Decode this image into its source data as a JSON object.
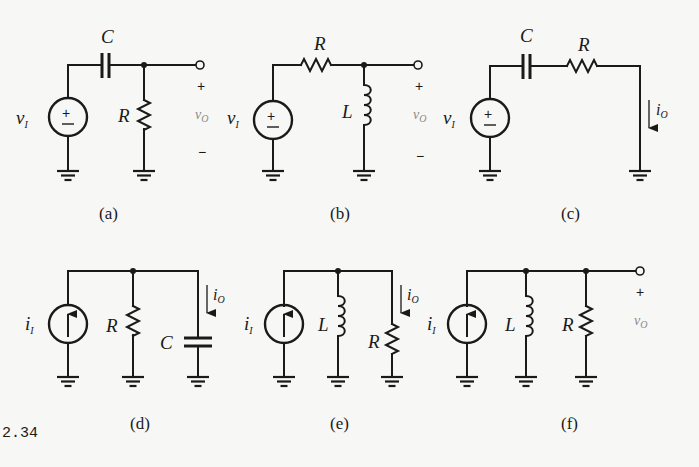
{
  "figure": {
    "number": "2.34",
    "panels": [
      {
        "id": "a",
        "caption": "(a)",
        "source": "v_I",
        "source_label": "v",
        "source_sub": "I",
        "source_type": "voltage",
        "series": [
          "C"
        ],
        "shunt": [
          "R"
        ],
        "output": "v_O",
        "out_label": "v",
        "out_sub": "O",
        "plus": "+",
        "minus": "−",
        "elements": {
          "C": "C",
          "R": "R"
        }
      },
      {
        "id": "b",
        "caption": "(b)",
        "source": "v_I",
        "source_label": "v",
        "source_sub": "I",
        "source_type": "voltage",
        "series": [
          "R"
        ],
        "shunt": [
          "L"
        ],
        "output": "v_O",
        "out_label": "v",
        "out_sub": "O",
        "plus": "+",
        "minus": "−",
        "elements": {
          "R": "R",
          "L": "L"
        }
      },
      {
        "id": "c",
        "caption": "(c)",
        "source": "v_I",
        "source_label": "v",
        "source_sub": "I",
        "source_type": "voltage",
        "series": [
          "C",
          "R"
        ],
        "shunt": [],
        "output": "i_O",
        "out_label": "i",
        "out_sub": "O",
        "elements": {
          "C": "C",
          "R": "R"
        }
      },
      {
        "id": "d",
        "caption": "(d)",
        "source": "i_I",
        "source_label": "i",
        "source_sub": "I",
        "source_type": "current",
        "series": [],
        "shunt": [
          "R",
          "C"
        ],
        "output": "i_O",
        "out_label": "i",
        "out_sub": "O",
        "elements": {
          "R": "R",
          "C": "C"
        }
      },
      {
        "id": "e",
        "caption": "(e)",
        "source": "i_I",
        "source_label": "i",
        "source_sub": "I",
        "source_type": "current",
        "series": [],
        "shunt": [
          "L",
          "R"
        ],
        "output": "i_O",
        "out_label": "i",
        "out_sub": "O",
        "elements": {
          "L": "L",
          "R": "R"
        }
      },
      {
        "id": "f",
        "caption": "(f)",
        "source": "i_I",
        "source_label": "i",
        "source_sub": "I",
        "source_type": "current",
        "series": [],
        "shunt": [
          "L",
          "R"
        ],
        "output": "v_O",
        "out_label": "v",
        "out_sub": "O",
        "plus": "+",
        "elements": {
          "L": "L",
          "R": "R"
        }
      }
    ]
  },
  "colors": {
    "ink": "#1a1a1a",
    "paper": "#f7f7f5",
    "faint_label": "#8a8a8a"
  }
}
